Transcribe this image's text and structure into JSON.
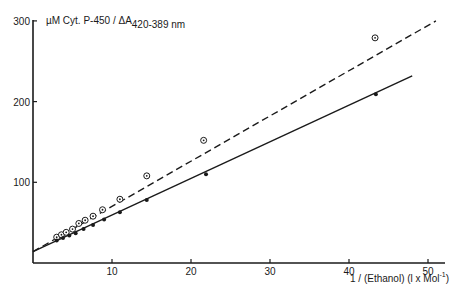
{
  "chart_data": {
    "type": "scatter",
    "title": "",
    "ylabel": "µM Cyt. P-450 / ΔA",
    "ylabel_subscript": "420-389 nm",
    "xlabel": "1 / (Ethanol) (l x Mol",
    "xlabel_superscript": "-1",
    "xlabel_suffix": ")",
    "xlim": [
      0,
      52
    ],
    "ylim": [
      0,
      300
    ],
    "x_ticks": [
      10,
      20,
      30,
      40,
      50
    ],
    "y_ticks": [
      100,
      200,
      300
    ],
    "grid": false,
    "legend": "none",
    "series": [
      {
        "name": "open circles",
        "marker": "open-circle",
        "line_style": "dashed",
        "fit_line": {
          "x": [
            0,
            51
          ],
          "y": [
            14,
            300
          ]
        },
        "points": [
          {
            "x": 3.0,
            "y": 32
          },
          {
            "x": 3.6,
            "y": 35
          },
          {
            "x": 4.2,
            "y": 38
          },
          {
            "x": 5.0,
            "y": 42
          },
          {
            "x": 5.8,
            "y": 49
          },
          {
            "x": 6.6,
            "y": 53
          },
          {
            "x": 7.6,
            "y": 58
          },
          {
            "x": 8.8,
            "y": 66
          },
          {
            "x": 11.0,
            "y": 79
          },
          {
            "x": 14.4,
            "y": 108
          },
          {
            "x": 21.6,
            "y": 152
          },
          {
            "x": 43.3,
            "y": 279
          }
        ]
      },
      {
        "name": "filled circles",
        "marker": "filled-circle",
        "line_style": "solid",
        "fit_line": {
          "x": [
            0,
            48
          ],
          "y": [
            14,
            232
          ]
        },
        "points": [
          {
            "x": 3.0,
            "y": 28
          },
          {
            "x": 3.8,
            "y": 31
          },
          {
            "x": 4.6,
            "y": 34
          },
          {
            "x": 5.4,
            "y": 37
          },
          {
            "x": 6.4,
            "y": 42
          },
          {
            "x": 7.6,
            "y": 47
          },
          {
            "x": 9.0,
            "y": 54
          },
          {
            "x": 11.0,
            "y": 63
          },
          {
            "x": 14.4,
            "y": 78
          },
          {
            "x": 21.9,
            "y": 110
          },
          {
            "x": 43.4,
            "y": 209
          }
        ]
      }
    ]
  }
}
